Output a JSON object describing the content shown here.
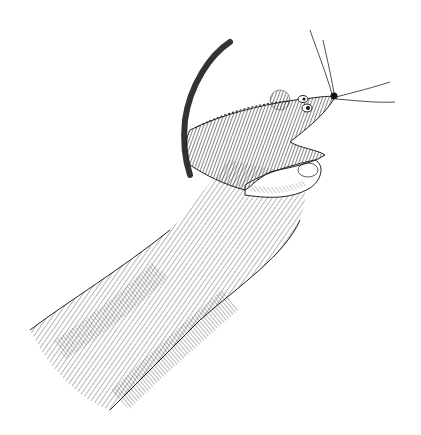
{
  "image": {
    "description": "Pen-and-ink crosshatched illustration of a hand and forearm holding a mouse finger puppet with long whiskers and a curved tail",
    "style": "black ink crosshatching on white",
    "subjects": [
      "hand",
      "forearm",
      "mouse finger puppet"
    ],
    "colors": {
      "background": "#ffffff",
      "ink": "#1a1a1a",
      "shade": "#555555"
    }
  }
}
